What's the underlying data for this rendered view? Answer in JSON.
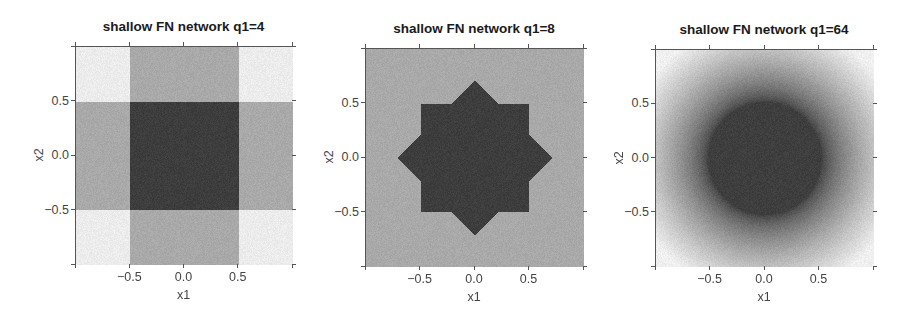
{
  "chart_data": [
    {
      "type": "heatmap",
      "title": "shallow FN network q1=4",
      "xlabel": "x1",
      "ylabel": "x2",
      "xlim": [
        -1,
        1
      ],
      "ylim": [
        -1,
        1
      ],
      "xticks": [
        -0.5,
        0.0,
        0.5
      ],
      "yticks": [
        -0.5,
        0.0,
        0.5
      ],
      "xtick_labels": [
        "−0.5",
        "0.0",
        "0.5"
      ],
      "ytick_labels": [
        "−0.5",
        "0.0",
        "0.5"
      ],
      "pattern": "square",
      "description": "Three-level grey map: dark square |x1|<0.5 and |x2|<0.5; mid-grey cross bands where exactly one of |x1|<0.5 or |x2|<0.5; light corners elsewhere",
      "half_width": 0.5,
      "colors": {
        "light": "#ececec",
        "mid": "#a9a9a9",
        "dark": "#3d3d3d"
      }
    },
    {
      "type": "heatmap",
      "title": "shallow FN network q1=8",
      "xlabel": "x1",
      "ylabel": "x2",
      "xlim": [
        -1,
        1
      ],
      "ylim": [
        -1,
        1
      ],
      "xticks": [
        -0.5,
        0.0,
        0.5
      ],
      "yticks": [
        -0.5,
        0.0,
        0.5
      ],
      "xtick_labels": [
        "−0.5",
        "0.0",
        "0.5"
      ],
      "ytick_labels": [
        "−0.5",
        "0.0",
        "0.5"
      ],
      "pattern": "octagram",
      "description": "Dark 8-point star (union of square |x1|,|x2|<0.5 and diamond |x1|+|x2|<0.707); mid-grey bands along axes and diagonals; light triangles elsewhere",
      "half_width": 0.5,
      "diamond_radius": 0.707,
      "colors": {
        "light": "#ececec",
        "mid": "#a9a9a9",
        "dark": "#3d3d3d"
      }
    },
    {
      "type": "heatmap",
      "title": "shallow FN network q1=64",
      "xlabel": "x1",
      "ylabel": "x2",
      "xlim": [
        -1,
        1
      ],
      "ylim": [
        -1,
        1
      ],
      "xticks": [
        -0.5,
        0.0,
        0.5
      ],
      "yticks": [
        -0.5,
        0.0,
        0.5
      ],
      "xtick_labels": [
        "−0.5",
        "0.0",
        "0.5"
      ],
      "ytick_labels": [
        "−0.5",
        "0.0",
        "0.5"
      ],
      "pattern": "disk",
      "description": "Dark disk of radius ~0.52 centered at origin with smooth radial falloff to light grey toward the corners",
      "radius": 0.52,
      "colors": {
        "light": "#f0f0f0",
        "mid": "#a9a9a9",
        "dark": "#3e3e3e"
      }
    }
  ],
  "layout": {
    "panels": [
      {
        "x": 75,
        "y": 46,
        "w": 217,
        "h": 218
      },
      {
        "x": 365,
        "y": 48,
        "w": 218,
        "h": 218
      },
      {
        "x": 655,
        "y": 49,
        "w": 218,
        "h": 217
      }
    ]
  }
}
